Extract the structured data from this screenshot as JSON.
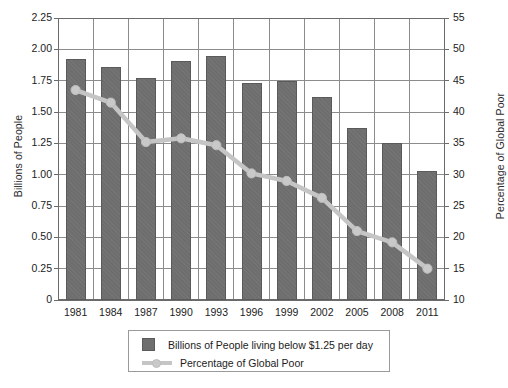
{
  "chart_data": {
    "type": "bar",
    "title": "",
    "subtitle": "",
    "xlabel": "",
    "ylabel": "Billions of People",
    "y2label": "Percentage of Global Poor",
    "categories": [
      "1981",
      "1984",
      "1987",
      "1990",
      "1993",
      "1996",
      "1999",
      "2002",
      "2005",
      "2008",
      "2011"
    ],
    "ylim": [
      0,
      2.25
    ],
    "y2lim": [
      10,
      55
    ],
    "yticks": [
      "0",
      "0.25",
      "0.50",
      "0.75",
      "1.00",
      "1.25",
      "1.50",
      "1.75",
      "2.00",
      "2.25"
    ],
    "ytick_values": [
      0,
      0.25,
      0.5,
      0.75,
      1.0,
      1.25,
      1.5,
      1.75,
      2.0,
      2.25
    ],
    "y2ticks": [
      "10",
      "15",
      "20",
      "25",
      "30",
      "35",
      "40",
      "45",
      "50",
      "55"
    ],
    "y2tick_values": [
      10,
      15,
      20,
      25,
      30,
      35,
      40,
      45,
      50,
      55
    ],
    "grid": true,
    "legend_position": "bottom",
    "series": [
      {
        "name": "Billions of People living below $1.25 per day",
        "type": "bar",
        "axis": "left",
        "color": "#6e6e6e",
        "values": [
          1.92,
          1.86,
          1.77,
          1.91,
          1.95,
          1.73,
          1.75,
          1.62,
          1.37,
          1.25,
          1.03
        ]
      },
      {
        "name": "Percentage of Global Poor",
        "type": "line",
        "axis": "right",
        "color": "#c5c5c5",
        "values": [
          43.5,
          41.5,
          35.2,
          35.8,
          34.7,
          30.2,
          29.0,
          26.3,
          21.0,
          19.2,
          15.0
        ]
      }
    ]
  },
  "legend": {
    "items": [
      {
        "label": "Billions of People living below $1.25 per day",
        "marker": "square-swatch"
      },
      {
        "label": "Percentage of Global Poor",
        "marker": "line-with-dot"
      }
    ]
  },
  "colors": {
    "bar": "#6e6e6e",
    "bar_edge": "#5a5a5a",
    "line": "#c5c5c5",
    "marker": "#c9c9c9",
    "grid": "#8c8c8c",
    "frame": "#6b6b6b",
    "background": "#ffffff"
  }
}
